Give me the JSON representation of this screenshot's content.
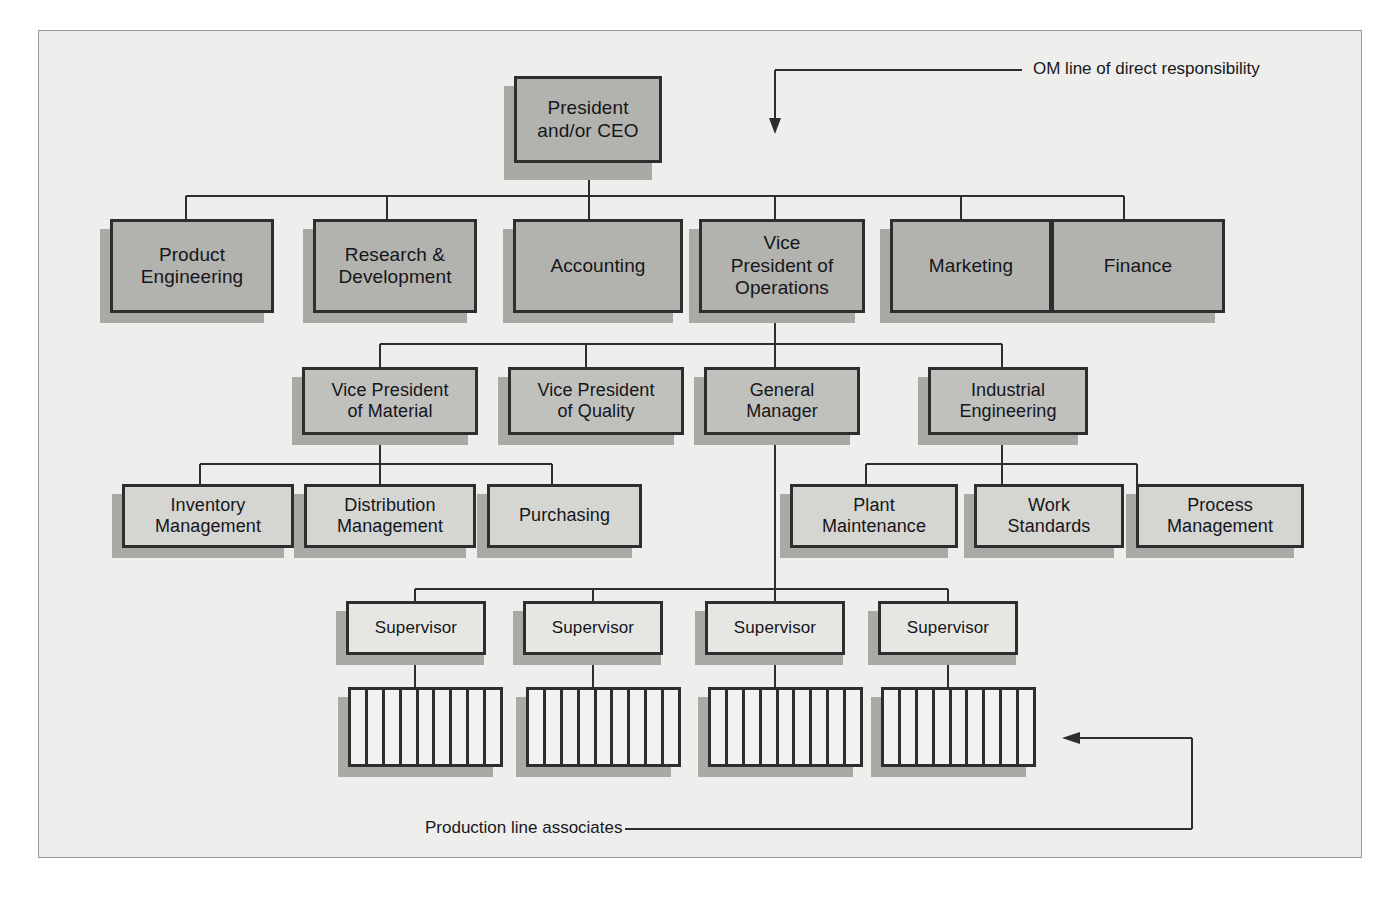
{
  "diagram": {
    "colors": {
      "page_background": "#eeeeec",
      "box_border": "#2e2e2e",
      "box_shadow": "#a9a9a6",
      "tone_dark": "#b2b2ae",
      "tone_mid": "#c0c0bd",
      "tone_light": "#d5d5d2",
      "tone_pale": "#e6e6e3",
      "connector": "#2e2e2e"
    },
    "levels": {
      "level1": {
        "label": "Executive"
      },
      "level2": {
        "label": "Departments"
      },
      "level3": {
        "label": "Operations direct reports"
      },
      "level4": {
        "label": "Functional groups"
      },
      "level5": {
        "label": "Supervisors"
      },
      "level6": {
        "label": "Production lines"
      }
    },
    "nodes": {
      "president": "President\nand/or CEO",
      "president_line1": "President",
      "president_line2": "and/or CEO",
      "product_engineering_l1": "Product",
      "product_engineering_l2": "Engineering",
      "research_development_l1": "Research &",
      "research_development_l2": "Development",
      "accounting": "Accounting",
      "vp_operations_l1": "Vice",
      "vp_operations_l2": "President of",
      "vp_operations_l3": "Operations",
      "marketing": "Marketing",
      "finance": "Finance",
      "vp_material_l1": "Vice President",
      "vp_material_l2": "of Material",
      "vp_quality_l1": "Vice President",
      "vp_quality_l2": "of Quality",
      "general_manager_l1": "General",
      "general_manager_l2": "Manager",
      "industrial_engineering_l1": "Industrial",
      "industrial_engineering_l2": "Engineering",
      "inventory_management_l1": "Inventory",
      "inventory_management_l2": "Management",
      "distribution_management_l1": "Distribution",
      "distribution_management_l2": "Management",
      "purchasing": "Purchasing",
      "plant_maintenance_l1": "Plant",
      "plant_maintenance_l2": "Maintenance",
      "work_standards_l1": "Work",
      "work_standards_l2": "Standards",
      "process_management_l1": "Process",
      "process_management_l2": "Management",
      "supervisor_1": "Supervisor",
      "supervisor_2": "Supervisor",
      "supervisor_3": "Supervisor",
      "supervisor_4": "Supervisor"
    },
    "production_lines": [
      {
        "name": "production-line-1",
        "cells": 9
      },
      {
        "name": "production-line-2",
        "cells": 9
      },
      {
        "name": "production-line-3",
        "cells": 9
      },
      {
        "name": "production-line-4",
        "cells": 9
      }
    ],
    "annotations": {
      "om_line": "OM line of direct responsibility",
      "production_line_associates": "Production line associates"
    }
  }
}
